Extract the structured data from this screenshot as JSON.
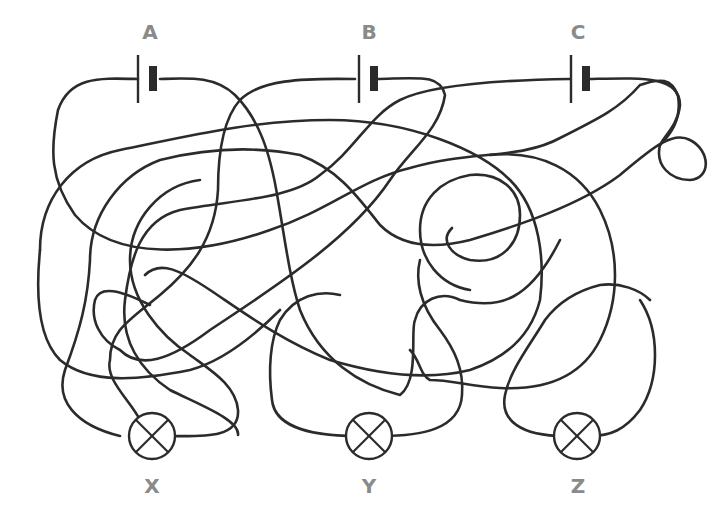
{
  "diagram": {
    "type": "tangled-wire circuit puzzle",
    "colors": {
      "wire": "#2b2b2b",
      "label": "#8a8a8a",
      "background": "#ffffff"
    },
    "batteries": [
      {
        "label": "A",
        "x": 145,
        "y": 78
      },
      {
        "label": "B",
        "x": 363,
        "y": 78
      },
      {
        "label": "C",
        "x": 578,
        "y": 78
      }
    ],
    "lamps": [
      {
        "label": "X",
        "x": 152,
        "y": 436
      },
      {
        "label": "Y",
        "x": 369,
        "y": 436
      },
      {
        "label": "Z",
        "x": 577,
        "y": 436
      }
    ]
  }
}
